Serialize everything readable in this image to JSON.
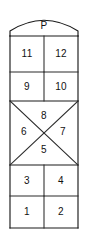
{
  "diagram": {
    "line_color": "#1b1b1b",
    "text_color": "#111111",
    "background_color": "#ffffff",
    "cells": [
      {
        "label": "P",
        "shape": "arched-top",
        "cx": 44,
        "cy": 26
      },
      {
        "label": "11",
        "shape": "rectangle-left",
        "cx": 27,
        "cy": 54
      },
      {
        "label": "12",
        "shape": "rectangle-right",
        "cx": 61,
        "cy": 54
      },
      {
        "label": "9",
        "shape": "rectangle-left",
        "cx": 27,
        "cy": 87
      },
      {
        "label": "10",
        "shape": "rectangle-right",
        "cx": 61,
        "cy": 87
      },
      {
        "label": "8",
        "shape": "triangle-top",
        "cx": 44,
        "cy": 116
      },
      {
        "label": "6",
        "shape": "triangle-left",
        "cx": 24,
        "cy": 132
      },
      {
        "label": "7",
        "shape": "triangle-right",
        "cx": 63,
        "cy": 132
      },
      {
        "label": "5",
        "shape": "triangle-bottom",
        "cx": 44,
        "cy": 150
      },
      {
        "label": "3",
        "shape": "rectangle-left",
        "cx": 27,
        "cy": 181
      },
      {
        "label": "4",
        "shape": "rectangle-right",
        "cx": 61,
        "cy": 181
      },
      {
        "label": "1",
        "shape": "rectangle-left",
        "cx": 27,
        "cy": 212
      },
      {
        "label": "2",
        "shape": "rectangle-right",
        "cx": 61,
        "cy": 212
      }
    ]
  }
}
